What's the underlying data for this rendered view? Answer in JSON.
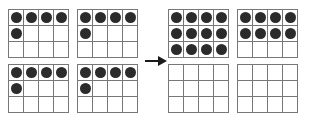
{
  "diagram": {
    "type": "base-ten grid regrouping",
    "grid": {
      "columns": 4,
      "rows": 3,
      "cells_per_grid": 12
    },
    "dot_color": "#2b2b2b",
    "grid_line_color": "#777777",
    "background_color": "#ffffff",
    "arrow": {
      "name": "right-arrow",
      "direction": "right",
      "glyph": "→",
      "color": "#1a1a1a"
    },
    "left_side": {
      "label": "before regrouping",
      "total_dots": 20,
      "grids": [
        {
          "name": "left-grid-1",
          "filled": 5,
          "fill_pattern": [
            1,
            1,
            1,
            1,
            1,
            0,
            0,
            0,
            0,
            0,
            0,
            0
          ]
        },
        {
          "name": "left-grid-2",
          "filled": 5,
          "fill_pattern": [
            1,
            1,
            1,
            1,
            1,
            0,
            0,
            0,
            0,
            0,
            0,
            0
          ]
        },
        {
          "name": "left-grid-3",
          "filled": 5,
          "fill_pattern": [
            1,
            1,
            1,
            1,
            1,
            0,
            0,
            0,
            0,
            0,
            0,
            0
          ]
        },
        {
          "name": "left-grid-4",
          "filled": 5,
          "fill_pattern": [
            1,
            1,
            1,
            1,
            1,
            0,
            0,
            0,
            0,
            0,
            0,
            0
          ]
        }
      ]
    },
    "right_side": {
      "label": "after regrouping",
      "total_dots": 20,
      "grids": [
        {
          "name": "right-grid-1",
          "filled": 12,
          "fill_pattern": [
            1,
            1,
            1,
            1,
            1,
            1,
            1,
            1,
            1,
            1,
            1,
            1
          ]
        },
        {
          "name": "right-grid-2",
          "filled": 8,
          "fill_pattern": [
            1,
            1,
            1,
            1,
            1,
            1,
            1,
            1,
            0,
            0,
            0,
            0
          ]
        },
        {
          "name": "right-grid-3",
          "filled": 0,
          "fill_pattern": [
            0,
            0,
            0,
            0,
            0,
            0,
            0,
            0,
            0,
            0,
            0,
            0
          ]
        },
        {
          "name": "right-grid-4",
          "filled": 0,
          "fill_pattern": [
            0,
            0,
            0,
            0,
            0,
            0,
            0,
            0,
            0,
            0,
            0,
            0
          ]
        }
      ]
    }
  }
}
